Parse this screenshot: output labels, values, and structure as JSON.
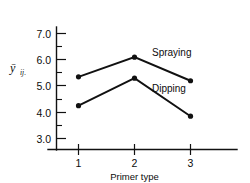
{
  "chart_data": {
    "type": "line",
    "title": "",
    "xlabel": "Primer type",
    "ylabel": "ȳ",
    "ylabel_subscript": "ij.",
    "categories": [
      "1",
      "2",
      "3"
    ],
    "x": [
      1,
      2,
      3
    ],
    "series": [
      {
        "name": "Spraying",
        "values": [
          5.35,
          6.1,
          5.2
        ]
      },
      {
        "name": "Dipping",
        "values": [
          4.25,
          5.3,
          3.85
        ]
      }
    ],
    "yticks": [
      "3.0",
      "4.0",
      "5.0",
      "6.0",
      "7.0"
    ],
    "ytick_values": [
      3.0,
      4.0,
      5.0,
      6.0,
      7.0
    ],
    "minor_ticks": [
      3.5,
      4.5,
      5.5,
      6.5
    ],
    "ylim": [
      2.55,
      7.45
    ],
    "xlim": [
      0.55,
      3.6
    ],
    "grid": false,
    "legend": "inline-annotations",
    "marker": "filled-circle",
    "line_color": "#111111"
  },
  "axes": {
    "y": {
      "ticks": [
        {
          "label": "7.0",
          "value": 7.0
        },
        {
          "label": "6.0",
          "value": 6.0
        },
        {
          "label": "5.0",
          "value": 5.0
        },
        {
          "label": "4.0",
          "value": 4.0
        },
        {
          "label": "3.0",
          "value": 3.0
        }
      ],
      "label_main": "ȳ",
      "label_sub": "ij."
    },
    "x": {
      "ticks": [
        {
          "label": "1",
          "value": 1
        },
        {
          "label": "2",
          "value": 2
        },
        {
          "label": "3",
          "value": 3
        }
      ],
      "title": "Primer type"
    }
  },
  "annotations": [
    {
      "text": "Spraying",
      "series": "Spraying"
    },
    {
      "text": "Dipping",
      "series": "Dipping"
    }
  ]
}
